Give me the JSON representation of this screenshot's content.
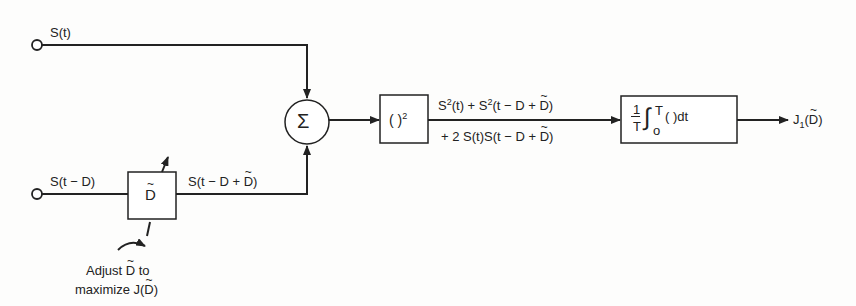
{
  "diagram": {
    "type": "signal-flow block diagram",
    "inputs": [
      {
        "id": "in1",
        "label": "S(t)"
      },
      {
        "id": "in2",
        "label": "S(t − D)"
      }
    ],
    "blocks": [
      {
        "id": "delay",
        "label": "D̃",
        "kind": "adjustable delay"
      },
      {
        "id": "sum",
        "label": "Σ",
        "kind": "summing junction"
      },
      {
        "id": "square",
        "label": "( )²",
        "kind": "squarer"
      },
      {
        "id": "integrator",
        "label": "1/T ∫₀ᵀ ( ) dt",
        "kind": "averager"
      }
    ],
    "edges": [
      {
        "from": "in1",
        "to": "sum",
        "label": ""
      },
      {
        "from": "in2",
        "to": "delay",
        "label": ""
      },
      {
        "from": "delay",
        "to": "sum",
        "label": "S(t − D + D̃)"
      },
      {
        "from": "sum",
        "to": "square",
        "label": ""
      },
      {
        "from": "square",
        "to": "integrator",
        "label": "S²(t) + S²(t − D + D̃) + 2 S(t)S(t − D + D̃)"
      },
      {
        "from": "integrator",
        "to": "output",
        "label": "J₁(D̃)"
      }
    ]
  },
  "labels": {
    "input1": "S(t)",
    "input2_prefix": "S(t − D)",
    "delay_out_prefix": "S(t − D + ",
    "delay_out_suffix": ")",
    "delay_symbol": "D",
    "sum_symbol": "Σ",
    "square_paren": "(  )",
    "square_exp": "2",
    "expr_line1_a": "S",
    "expr_line1_b": "(t) + S",
    "expr_line1_c": "(t − D + ",
    "expr_line1_d": ")",
    "expr_exp": "2",
    "expr_line2_a": "+ 2 S(t)S(t − D + ",
    "expr_line2_b": ")",
    "int_num": "1",
    "int_den": "T",
    "int_sign": "∫",
    "int_upper": "T",
    "int_lower": "o",
    "int_body": "(  )dt",
    "output_J": "J",
    "output_sub": "1",
    "output_open": "(",
    "output_close": ")",
    "adjust_line1_a": "Adjust ",
    "adjust_line1_b": " to",
    "adjust_line2_a": "maximize J(",
    "adjust_line2_b": ")"
  }
}
